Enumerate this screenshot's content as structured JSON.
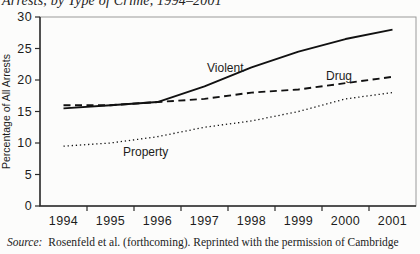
{
  "title": "Arrests, by Type of Crime, 1994–2001",
  "source": {
    "label": "Source:",
    "text": "Rosenfeld et al. (forthcoming). Reprinted with the permission of Cambridge"
  },
  "chart_data": {
    "type": "line",
    "x": [
      "1994",
      "1995",
      "1996",
      "1997",
      "1998",
      "1999",
      "2000",
      "2001"
    ],
    "series": [
      {
        "name": "Violent",
        "line_style": "solid",
        "values": [
          15.5,
          16,
          16.5,
          19,
          22,
          24.5,
          26.5,
          28
        ],
        "label_x": 207,
        "label_y": 72
      },
      {
        "name": "Drug",
        "line_style": "dashed",
        "values": [
          16,
          16,
          16.5,
          17,
          18,
          18.5,
          19.5,
          20.5
        ],
        "label_x": 326,
        "label_y": 80
      },
      {
        "name": "Property",
        "line_style": "dotted",
        "values": [
          9.5,
          10,
          11,
          12.5,
          13.5,
          15,
          17,
          18
        ],
        "label_x": 123,
        "label_y": 156
      }
    ],
    "xlabel": "",
    "ylabel": "Percentage of All Arrests",
    "ylim": [
      0,
      30
    ],
    "yticks": [
      0,
      5,
      10,
      15,
      20,
      25,
      30
    ],
    "grid": "off",
    "legend": "inline-labels",
    "line_color": "#111111",
    "frame_color": "#9a9a9a",
    "axis_color": "#2a2a2a"
  }
}
